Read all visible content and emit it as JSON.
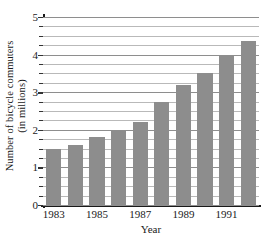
{
  "chart_data": {
    "type": "bar",
    "title": "",
    "xlabel": "Year",
    "ylabel_line1": "Number of bicycle commuters",
    "ylabel_line2": "(in millions)",
    "categories": [
      "1983",
      "1984",
      "1985",
      "1986",
      "1987",
      "1988",
      "1989",
      "1990",
      "1991",
      "1992"
    ],
    "values": [
      1.5,
      1.6,
      1.8,
      2.0,
      2.2,
      2.75,
      3.2,
      3.5,
      4.0,
      4.35
    ],
    "ylim": [
      0,
      5
    ],
    "xtick_labels": [
      "1983",
      "1985",
      "1987",
      "1989",
      "1991"
    ],
    "xtick_categories": [
      "1983",
      "1985",
      "1987",
      "1989",
      "1991"
    ],
    "ytick_labels": [
      "0",
      "1",
      "2",
      "3",
      "4",
      "5"
    ],
    "ytick_values": [
      0,
      1,
      2,
      3,
      4,
      5
    ],
    "minor_gridline_step": 0.25,
    "grid": true,
    "legend": "none",
    "bar_color": "#8d8d8d",
    "gridline_color": "#b9b9b9",
    "axis_color": "#1a1a1a"
  }
}
